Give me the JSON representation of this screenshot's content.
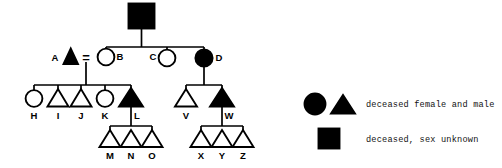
{
  "figure": {
    "kind": "pedigree-chart",
    "background_color": "#ffffff",
    "ink_color": "#000000"
  },
  "pedigree": {
    "generations": [
      {
        "id": "gen-1",
        "members": [
          {
            "id": "founder",
            "label": "",
            "shape": "square",
            "fill": "filled",
            "meaning": "deceased, sex unknown"
          }
        ]
      },
      {
        "id": "gen-2",
        "members": [
          {
            "id": "A",
            "label": "A",
            "shape": "triangle",
            "fill": "filled",
            "meaning": "deceased male"
          },
          {
            "id": "B",
            "label": "B",
            "shape": "circle",
            "fill": "open",
            "meaning": "female"
          },
          {
            "id": "C",
            "label": "C",
            "shape": "circle",
            "fill": "open",
            "meaning": "female"
          },
          {
            "id": "D",
            "label": "D",
            "shape": "circle",
            "fill": "filled",
            "meaning": "deceased female"
          }
        ]
      },
      {
        "id": "gen-3",
        "members": [
          {
            "id": "H",
            "label": "H",
            "shape": "circle",
            "fill": "open",
            "meaning": "female"
          },
          {
            "id": "I",
            "label": "I",
            "shape": "triangle",
            "fill": "open",
            "meaning": "male"
          },
          {
            "id": "J",
            "label": "J",
            "shape": "triangle",
            "fill": "open",
            "meaning": "male"
          },
          {
            "id": "K",
            "label": "K",
            "shape": "circle",
            "fill": "open",
            "meaning": "female"
          },
          {
            "id": "L",
            "label": "L",
            "shape": "triangle",
            "fill": "filled",
            "meaning": "deceased male"
          },
          {
            "id": "V",
            "label": "V",
            "shape": "triangle",
            "fill": "open",
            "meaning": "male"
          },
          {
            "id": "W",
            "label": "W",
            "shape": "triangle",
            "fill": "filled",
            "meaning": "deceased male"
          }
        ]
      },
      {
        "id": "gen-4",
        "members": [
          {
            "id": "M",
            "label": "M",
            "shape": "triangle",
            "fill": "open",
            "meaning": "male"
          },
          {
            "id": "N",
            "label": "N",
            "shape": "triangle",
            "fill": "open",
            "meaning": "male"
          },
          {
            "id": "O",
            "label": "O",
            "shape": "triangle",
            "fill": "open",
            "meaning": "male"
          },
          {
            "id": "X",
            "label": "X",
            "shape": "triangle",
            "fill": "open",
            "meaning": "male"
          },
          {
            "id": "Y",
            "label": "Y",
            "shape": "triangle",
            "fill": "open",
            "meaning": "male"
          },
          {
            "id": "Z",
            "label": "Z",
            "shape": "triangle",
            "fill": "open",
            "meaning": "male"
          }
        ]
      }
    ],
    "mating_symbol": "=",
    "matings": [
      {
        "id": "A-B",
        "partners": [
          "A",
          "B"
        ],
        "symbol": "=",
        "children": [
          "H",
          "I",
          "J",
          "K",
          "L"
        ]
      },
      {
        "id": "D-line",
        "partners": [
          "D"
        ],
        "symbol": "",
        "children": [
          "V",
          "W"
        ]
      },
      {
        "id": "L-line",
        "partners": [
          "L"
        ],
        "symbol": "",
        "children": [
          "M",
          "N",
          "O"
        ]
      },
      {
        "id": "W-line",
        "partners": [
          "W"
        ],
        "symbol": "",
        "children": [
          "X",
          "Y",
          "Z"
        ]
      },
      {
        "id": "founder-line",
        "partners": [
          "founder"
        ],
        "symbol": "",
        "children": [
          "B",
          "C",
          "D"
        ]
      }
    ]
  },
  "legend": {
    "entries": [
      {
        "id": "legend-deceased-female-male",
        "symbols": [
          "filled-circle",
          "filled-triangle"
        ],
        "text": "deceased female and male"
      },
      {
        "id": "legend-deceased-unknown",
        "symbols": [
          "filled-square"
        ],
        "text": "deceased, sex unknown"
      }
    ]
  }
}
